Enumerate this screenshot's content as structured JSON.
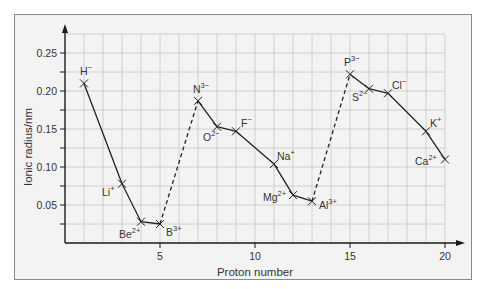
{
  "chart_data": {
    "type": "line",
    "title": "",
    "xlabel": "Proton number",
    "ylabel": "Ionic radius/nm",
    "xlim": [
      0,
      20
    ],
    "ylim": [
      0,
      0.275
    ],
    "grid": true,
    "legend": null,
    "x_ticks": [
      5,
      10,
      15,
      20
    ],
    "x_tick_labels": [
      "5",
      "10",
      "15",
      "20"
    ],
    "y_ticks": [
      0.05,
      0.1,
      0.15,
      0.2,
      0.25
    ],
    "y_tick_labels": [
      "0.05",
      "0.10",
      "0.15",
      "0.20",
      "0.25"
    ],
    "points": [
      {
        "ion": "H",
        "charge": "−",
        "z": 1,
        "r": 0.21,
        "label_dx": -4,
        "label_dy": -8
      },
      {
        "ion": "Li",
        "charge": "+",
        "z": 3,
        "r": 0.078,
        "label_dx": -20,
        "label_dy": 12
      },
      {
        "ion": "Be",
        "charge": "2+",
        "z": 4,
        "r": 0.028,
        "label_dx": -22,
        "label_dy": 16
      },
      {
        "ion": "B",
        "charge": "3+",
        "z": 5,
        "r": 0.025,
        "label_dx": 6,
        "label_dy": 12
      },
      {
        "ion": "N",
        "charge": "3−",
        "z": 7,
        "r": 0.187,
        "label_dx": -5,
        "label_dy": -8
      },
      {
        "ion": "O",
        "charge": "2−",
        "z": 8,
        "r": 0.153,
        "label_dx": -14,
        "label_dy": 14
      },
      {
        "ion": "F",
        "charge": "−",
        "z": 9,
        "r": 0.147,
        "label_dx": 5,
        "label_dy": -4
      },
      {
        "ion": "Na",
        "charge": "+",
        "z": 11,
        "r": 0.104,
        "label_dx": 3,
        "label_dy": -4
      },
      {
        "ion": "Mg",
        "charge": "2+",
        "z": 12,
        "r": 0.063,
        "label_dx": -30,
        "label_dy": 6
      },
      {
        "ion": "Al",
        "charge": "3+",
        "z": 13,
        "r": 0.055,
        "label_dx": 7,
        "label_dy": 8
      },
      {
        "ion": "P",
        "charge": "3−",
        "z": 15,
        "r": 0.222,
        "label_dx": -6,
        "label_dy": -8
      },
      {
        "ion": "S",
        "charge": "2−",
        "z": 16,
        "r": 0.203,
        "label_dx": -17,
        "label_dy": 12
      },
      {
        "ion": "Cl",
        "charge": "−",
        "z": 17,
        "r": 0.197,
        "label_dx": 4,
        "label_dy": -4
      },
      {
        "ion": "K",
        "charge": "+",
        "z": 19,
        "r": 0.147,
        "label_dx": 4,
        "label_dy": -4
      },
      {
        "ion": "Ca",
        "charge": "2+",
        "z": 20,
        "r": 0.11,
        "label_dx": -30,
        "label_dy": 6
      }
    ],
    "segments": [
      {
        "from": 0,
        "to": 1,
        "style": "solid"
      },
      {
        "from": 1,
        "to": 2,
        "style": "solid"
      },
      {
        "from": 2,
        "to": 3,
        "style": "solid"
      },
      {
        "from": 3,
        "to": 4,
        "style": "dashed"
      },
      {
        "from": 4,
        "to": 5,
        "style": "solid"
      },
      {
        "from": 5,
        "to": 6,
        "style": "solid"
      },
      {
        "from": 6,
        "to": 7,
        "style": "solid"
      },
      {
        "from": 7,
        "to": 8,
        "style": "solid"
      },
      {
        "from": 8,
        "to": 9,
        "style": "solid"
      },
      {
        "from": 9,
        "to": 10,
        "style": "dashed"
      },
      {
        "from": 10,
        "to": 11,
        "style": "solid"
      },
      {
        "from": 11,
        "to": 12,
        "style": "solid"
      },
      {
        "from": 12,
        "to": 13,
        "style": "solid"
      },
      {
        "from": 13,
        "to": 14,
        "style": "solid"
      }
    ],
    "colors": {
      "background": "#f3f3f3",
      "grid": "#c6c6c6",
      "line": "#222222",
      "frame": "#8a8a8a"
    }
  }
}
